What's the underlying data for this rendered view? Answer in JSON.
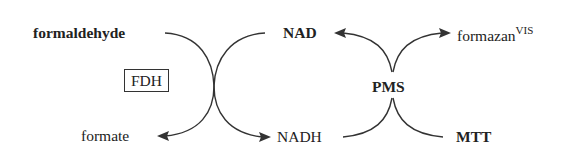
{
  "diagram": {
    "nodes": {
      "formaldehyde": "formaldehyde",
      "formate": "formate",
      "nad": "NAD",
      "nadh": "NADH",
      "pms": "PMS",
      "mtt": "MTT",
      "formazan": "formazan",
      "formazan_sup": "VIS"
    },
    "enzyme": "FDH",
    "edges": [
      {
        "from": "formaldehyde",
        "to": "formate",
        "via": "FDH"
      },
      {
        "from": "NAD",
        "to": "NADH",
        "via": "FDH"
      },
      {
        "from": "NADH",
        "to": "NAD",
        "via": "PMS"
      },
      {
        "from": "MTT",
        "to": "formazan",
        "via": "PMS"
      }
    ],
    "colors": {
      "ink": "#222222",
      "background": "#ffffff"
    }
  }
}
